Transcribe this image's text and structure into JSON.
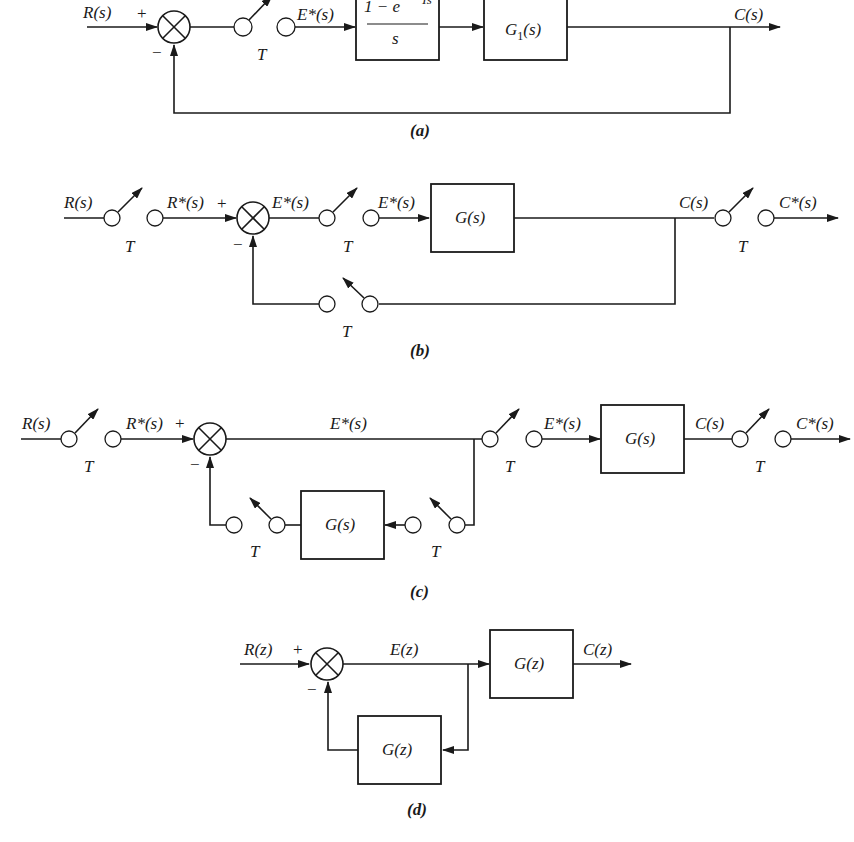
{
  "figure": {
    "a": {
      "caption": "(a)",
      "input": "R(s)",
      "plus": "+",
      "minus": "−",
      "sampler_period": "T",
      "sampled_error": "E*(s)",
      "zoh_num": "1 − e",
      "zoh_exp": "−Ts",
      "zoh_den": "s",
      "plant": "G",
      "plant_sub": "1",
      "plant_arg": "(s)",
      "output": "C(s)"
    },
    "b": {
      "caption": "(b)",
      "input": "R(s)",
      "sampled_input": "R*(s)",
      "plus": "+",
      "minus": "−",
      "error": "E*(s)",
      "sampled_error": "E*(s)",
      "plant": "G(s)",
      "output": "C(s)",
      "sampled_output": "C*(s)",
      "sampler_period": "T"
    },
    "c": {
      "caption": "(c)",
      "input": "R(s)",
      "sampled_input": "R*(s)",
      "plus": "+",
      "minus": "−",
      "error": "E*(s)",
      "sampled_error": "E*(s)",
      "plant": "G(s)",
      "feedback_block": "G(s)",
      "output": "C(s)",
      "sampled_output": "C*(s)",
      "sampler_period": "T"
    },
    "d": {
      "caption": "(d)",
      "input": "R(z)",
      "plus": "+",
      "minus": "−",
      "error": "E(z)",
      "plant": "G(z)",
      "feedback_block": "G(z)",
      "output": "C(z)"
    }
  }
}
